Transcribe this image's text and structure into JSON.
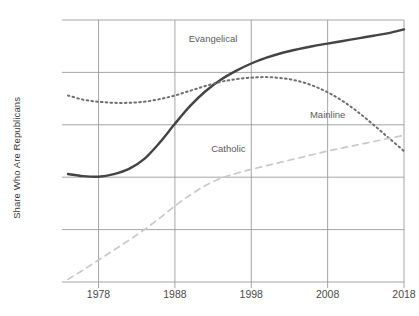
{
  "chart_data": {
    "type": "line",
    "title": "",
    "xlabel": "",
    "ylabel": "Share Who Are Republicans",
    "xlim": [
      1974,
      2018
    ],
    "ylim": [
      20,
      70
    ],
    "xticks": [
      "1978",
      "1988",
      "1998",
      "2008",
      "2018"
    ],
    "xtick_values": [
      1978,
      1988,
      1998,
      2008,
      2018
    ],
    "yticks": [
      "20%",
      "30%",
      "40%",
      "50%",
      "60%",
      "70%"
    ],
    "ytick_values": [
      20,
      30,
      40,
      50,
      60,
      70
    ],
    "grid": true,
    "legend_position": "inline-annotations",
    "series": [
      {
        "name": "Evangelical",
        "style": "solid",
        "color": "#444444",
        "label_x": 1993,
        "label_y": 66.5,
        "x": [
          1974,
          1976,
          1978,
          1980,
          1982,
          1984,
          1986,
          1988,
          1990,
          1992,
          1994,
          1996,
          1998,
          2000,
          2002,
          2004,
          2006,
          2008,
          2010,
          2012,
          2014,
          2016,
          2018
        ],
        "y": [
          40.6,
          40.2,
          40.1,
          40.6,
          41.6,
          43.5,
          46.6,
          50.2,
          53.6,
          56.4,
          58.6,
          60.3,
          61.7,
          62.8,
          63.7,
          64.4,
          65.0,
          65.5,
          66.0,
          66.5,
          67.0,
          67.5,
          68.2
        ]
      },
      {
        "name": "Mainline",
        "style": "dotted",
        "color": "#6e6e6e",
        "label_x": 2008,
        "label_y": 52.0,
        "x": [
          1974,
          1976,
          1978,
          1980,
          1982,
          1984,
          1986,
          1988,
          1990,
          1992,
          1994,
          1996,
          1998,
          2000,
          2002,
          2004,
          2006,
          2008,
          2010,
          2012,
          2014,
          2016,
          2018
        ],
        "y": [
          55.6,
          54.8,
          54.4,
          54.2,
          54.2,
          54.4,
          54.9,
          55.6,
          56.5,
          57.4,
          58.2,
          58.7,
          59.0,
          59.1,
          58.9,
          58.4,
          57.5,
          56.2,
          54.5,
          52.4,
          50.0,
          47.5,
          45.0
        ]
      },
      {
        "name": "Catholic",
        "style": "dashed",
        "color": "#c9c9c9",
        "label_x": 1995,
        "label_y": 45.5,
        "x": [
          1974,
          1976,
          1978,
          1980,
          1982,
          1984,
          1986,
          1988,
          1990,
          1992,
          1994,
          1996,
          1998,
          2000,
          2002,
          2004,
          2006,
          2008,
          2010,
          2012,
          2014,
          2016,
          2018
        ],
        "y": [
          20.5,
          22.3,
          24.2,
          26.1,
          28.0,
          30.0,
          32.2,
          34.5,
          36.6,
          38.4,
          39.8,
          40.7,
          41.5,
          42.2,
          42.9,
          43.6,
          44.3,
          45.0,
          45.6,
          46.2,
          46.8,
          47.4,
          48.0
        ]
      }
    ]
  },
  "colors": {
    "grid": "#9b9b9b",
    "axis_text": "#4a4a4a",
    "background": "#ffffff"
  }
}
